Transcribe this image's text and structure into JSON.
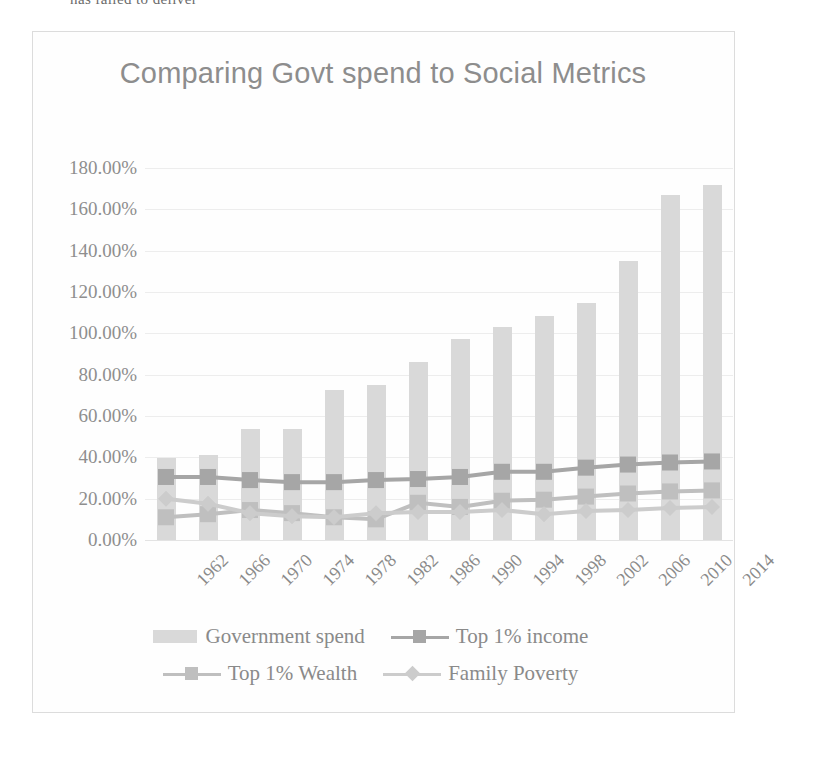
{
  "clipped_top_text": "has failed to deliver",
  "chart": {
    "title": "Comparing Govt spend to Social Metrics",
    "colors": {
      "government_spend": "#d9d9d9",
      "top1_income": "#a6a6a6",
      "top1_wealth": "#bfbfbf",
      "family_poverty": "#cccccc",
      "title_text": "#8d8d8d",
      "axis_text": "#8a8a8a",
      "gridline": "#ededed"
    }
  },
  "chart_data": {
    "type": "bar",
    "title": "Comparing Govt spend to Social Metrics",
    "xlabel": "",
    "ylabel": "",
    "ylim": [
      0,
      180
    ],
    "ytick_labels": [
      "180.00%",
      "160.00%",
      "140.00%",
      "120.00%",
      "100.00%",
      "80.00%",
      "60.00%",
      "40.00%",
      "20.00%",
      "0.00%"
    ],
    "ytick_values": [
      180,
      160,
      140,
      120,
      100,
      80,
      60,
      40,
      20,
      0
    ],
    "grid": true,
    "legend_position": "bottom",
    "categories": [
      "1962",
      "1966",
      "1970",
      "1974",
      "1978",
      "1982",
      "1986",
      "1990",
      "1994",
      "1998",
      "2002",
      "2006",
      "2010",
      "2014"
    ],
    "series": [
      {
        "name": "Government spend",
        "kind": "bar",
        "marker": "none",
        "color": "#d9d9d9",
        "values": [
          39.5,
          41.0,
          53.5,
          53.5,
          72.5,
          75.0,
          86.0,
          97.5,
          103.0,
          108.5,
          114.5,
          135.0,
          167.0,
          172.0
        ]
      },
      {
        "name": "Top 1% income",
        "kind": "line",
        "marker": "square",
        "color": "#a6a6a6",
        "values": [
          30.5,
          30.5,
          29.0,
          28.0,
          28.0,
          29.0,
          29.5,
          30.5,
          33.0,
          33.0,
          35.0,
          36.5,
          37.5,
          38.0
        ]
      },
      {
        "name": "Top 1% Wealth",
        "kind": "line",
        "marker": "square",
        "color": "#bfbfbf",
        "values": [
          11.0,
          12.5,
          14.5,
          13.0,
          11.0,
          10.0,
          18.0,
          16.0,
          19.0,
          19.5,
          21.0,
          22.5,
          23.5,
          24.0
        ]
      },
      {
        "name": "Family Poverty",
        "kind": "line",
        "marker": "diamond",
        "color": "#cccccc",
        "values": [
          20.0,
          17.5,
          13.0,
          11.5,
          11.0,
          13.0,
          13.5,
          13.5,
          14.5,
          12.5,
          14.0,
          14.5,
          15.5,
          16.0
        ]
      }
    ]
  }
}
